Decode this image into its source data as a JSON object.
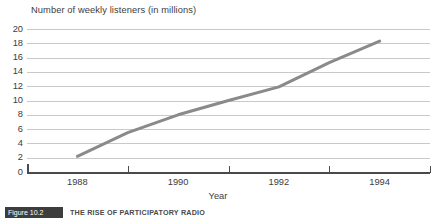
{
  "chart_data": {
    "type": "line",
    "title": "Number of weekly listeners (in millions)",
    "xlabel": "Year",
    "ylabel": "",
    "x": [
      1988,
      1989,
      1990,
      1991,
      1992,
      1993,
      1994
    ],
    "values": [
      2.2,
      5.5,
      8.0,
      10.0,
      11.9,
      15.3,
      18.3
    ],
    "series": [
      {
        "name": "Weekly listeners",
        "values": [
          2.2,
          5.5,
          8.0,
          10.0,
          11.9,
          15.3,
          18.3
        ]
      }
    ],
    "xlim": [
      1987,
      1995
    ],
    "ylim": [
      0,
      20
    ],
    "y_ticks": [
      0,
      2,
      4,
      6,
      8,
      10,
      12,
      14,
      16,
      18,
      20
    ],
    "x_tick_labels": [
      "1988",
      "1990",
      "1992",
      "1994"
    ],
    "x_tick_positions": [
      1988,
      1990,
      1992,
      1994
    ],
    "x_minor_ticks": [
      1987,
      1989,
      1991,
      1993,
      1995
    ],
    "grid": "horizontal",
    "legend": "none",
    "line_color": "#8a8a8a",
    "grid_color": "#c9c9c9",
    "axis_color": "#4a4a4a",
    "text_color": "#3c3c3c"
  },
  "caption": {
    "badge_label": "Figure 10.2",
    "text": "THE RISE OF PARTICIPATORY RADIO"
  }
}
